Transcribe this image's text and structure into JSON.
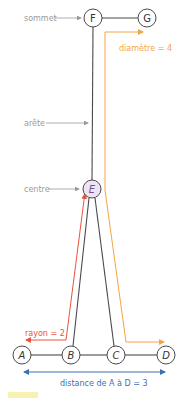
{
  "diagram": {
    "type": "graph",
    "nodes": [
      {
        "id": "F",
        "label": "F",
        "x": 93,
        "y": 18
      },
      {
        "id": "G",
        "label": "G",
        "x": 147,
        "y": 18
      },
      {
        "id": "E",
        "label": "E",
        "x": 92,
        "y": 189,
        "highlight": true
      },
      {
        "id": "A",
        "label": "A",
        "x": 22,
        "y": 355
      },
      {
        "id": "B",
        "label": "B",
        "x": 71,
        "y": 355
      },
      {
        "id": "C",
        "label": "C",
        "x": 116,
        "y": 355
      },
      {
        "id": "D",
        "label": "D",
        "x": 166,
        "y": 355
      }
    ],
    "edges": [
      [
        "F",
        "G"
      ],
      [
        "F",
        "E"
      ],
      [
        "E",
        "B"
      ],
      [
        "E",
        "C"
      ],
      [
        "A",
        "B"
      ],
      [
        "B",
        "C"
      ],
      [
        "C",
        "D"
      ]
    ],
    "annotations": {
      "sommet": "sommet",
      "arete": "arête",
      "centre": "centre",
      "diametre": "diamètre = 4",
      "rayon": "rayon = 2",
      "distance": "distance de A à D = 3"
    },
    "colors": {
      "edge": "#4a4a4a",
      "node_stroke": "#4a4a4a",
      "center_fill": "#ece4f2",
      "center_text": "#7a4b9a",
      "label_gray": "#9a9a9a",
      "diameter": "#f2a646",
      "radius": "#e8553a",
      "distance": "#3a6fb5",
      "legend_swatch": "#f7f2b0"
    }
  }
}
